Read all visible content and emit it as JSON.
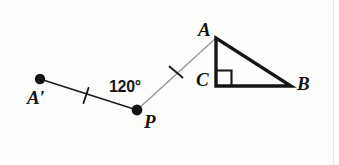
{
  "figure": {
    "type": "geometry-diagram",
    "background_color": "#fdfdfc",
    "stroke_color": "#151515",
    "light_stroke_color": "#9a9a9a",
    "labels": {
      "A": "A",
      "A_prime": "A′",
      "B": "B",
      "C": "C",
      "P": "P",
      "angle": "120°"
    },
    "points": {
      "A": {
        "x": 216,
        "y": 38
      },
      "A_prime": {
        "x": 40,
        "y": 79
      },
      "B": {
        "x": 291,
        "y": 86
      },
      "C": {
        "x": 216,
        "y": 86
      },
      "P": {
        "x": 137,
        "y": 110
      }
    },
    "dot_radius": 5,
    "triangle": {
      "vertices": [
        "A",
        "C",
        "B"
      ],
      "stroke_width": 3.2,
      "right_angle_at": "C",
      "right_angle_size": 15
    },
    "segments": [
      {
        "name": "A-prime-to-P",
        "from": "A_prime",
        "to": "P",
        "stroke_width": 1.6,
        "color": "#1d1d1d",
        "tick": true
      },
      {
        "name": "P-to-A",
        "from": "P",
        "to": "A",
        "stroke_width": 1.4,
        "color": "#9a9a9a",
        "tick": true
      }
    ],
    "tick_marks": [
      {
        "name": "tick-on-A-prime-P",
        "x": 86,
        "y": 95,
        "length": 15,
        "angle_deg": 72
      },
      {
        "name": "tick-on-P-A",
        "x": 176,
        "y": 72,
        "length": 17,
        "angle_deg": 140
      }
    ]
  }
}
